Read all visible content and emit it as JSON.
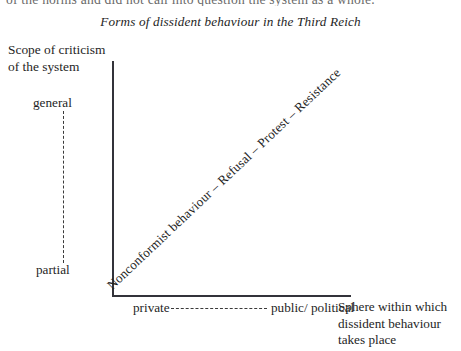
{
  "page": {
    "running_text_above": "of the norms and did not call into question the system as a whole."
  },
  "figure": {
    "title": "Forms of dissident behaviour in the Third Reich"
  },
  "chart_data": {
    "type": "scatter",
    "title": "Forms of dissident behaviour in the Third Reich",
    "xlabel": "Sphere within which dissident behaviour takes place",
    "ylabel": "Scope of criticism of the system",
    "x_axis_title_lines": [
      "Sphere within which",
      "dissident behaviour",
      "takes place"
    ],
    "y_axis_title_lines": [
      "Scope of criticism",
      "of the system"
    ],
    "x_tick_labels": [
      "private",
      "public/ political"
    ],
    "x_tick_label_lines": [
      [
        "private"
      ],
      [
        "public/",
        "political"
      ]
    ],
    "y_tick_labels": [
      "partial",
      "general"
    ],
    "grid": false,
    "legend": "none",
    "annotations": [
      {
        "name": "diagonal-progression",
        "text": "Nonconformist behaviour – Refusal – Protest – Resistance",
        "orientation": "diagonal",
        "from": {
          "x": "private",
          "y": "partial"
        },
        "to": {
          "x": "public/ political",
          "y": "general"
        }
      }
    ],
    "series": [
      {
        "name": "Forms of dissident behaviour",
        "points": [
          {
            "label": "Nonconformist behaviour",
            "x": "private",
            "y": "partial"
          },
          {
            "label": "Refusal",
            "x": "private-public",
            "y": "partial-general"
          },
          {
            "label": "Protest",
            "x": "public-leaning",
            "y": "general-leaning"
          },
          {
            "label": "Resistance",
            "x": "public/ political",
            "y": "general"
          }
        ]
      }
    ]
  },
  "colors": {
    "axis": "#33333a",
    "text": "#1e1e1e",
    "background": "#ffffff"
  }
}
